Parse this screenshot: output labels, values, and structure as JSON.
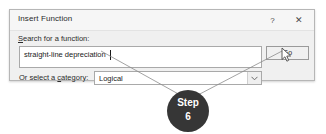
{
  "dialog": {
    "title": "Insert Function",
    "titlebar": {
      "help_label": "?",
      "close_label": "✕"
    },
    "search": {
      "label_accel": "S",
      "label_rest": "earch for a function:",
      "value": "straight-line depreciation",
      "placeholder": "Type a brief description of what you want to do and then click Go"
    },
    "go_button": {
      "label": "Go"
    },
    "category": {
      "label_prefix": "Or select a ",
      "label_accel": "c",
      "label_suffix": "ategory:",
      "value": "Logical",
      "options": [
        "Most Recently Used",
        "All",
        "Financial",
        "Date & Time",
        "Math & Trig",
        "Statistical",
        "Lookup & Reference",
        "Database",
        "Text",
        "Logical",
        "Information",
        "Engineering",
        "Cube",
        "Compatibility",
        "Web"
      ]
    }
  },
  "callout": {
    "step_word": "Step",
    "step_number": "6"
  },
  "colors": {
    "badge_background": "#363636",
    "badge_text": "#ffffff",
    "dialog_background": "#f0f0f0",
    "dialog_border": "#b6b6b6",
    "field_background": "#ffffff",
    "field_border": "#a9a9a9",
    "leader_line": "#8c8c8c"
  }
}
